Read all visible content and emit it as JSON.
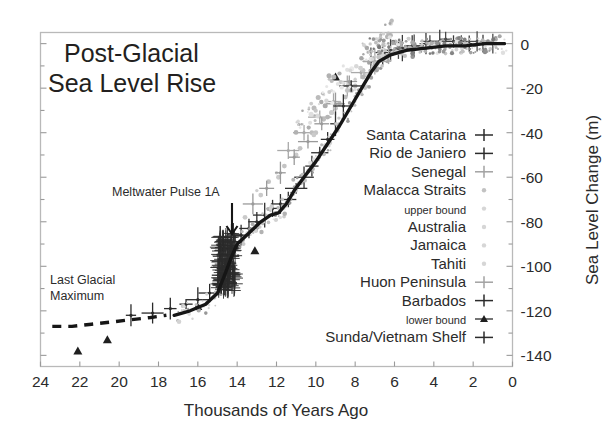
{
  "chart_data": {
    "type": "scatter",
    "title": "Post-Glacial\nSea Level Rise",
    "title_line1": "Post-Glacial",
    "title_line2": "Sea Level Rise",
    "xlabel": "Thousands of Years Ago",
    "ylabel": "Sea Level Change (m)",
    "xlim": [
      24,
      0
    ],
    "ylim": [
      -145,
      5
    ],
    "x_ticks": [
      24,
      22,
      20,
      18,
      16,
      14,
      12,
      10,
      8,
      6,
      4,
      2,
      0
    ],
    "y_ticks": [
      0,
      -20,
      -40,
      -60,
      -80,
      -100,
      -120,
      -140
    ],
    "y_minor_step": 10,
    "x_axis_inverted": true,
    "y_axis_side": "right",
    "grid": false,
    "legend_position": "inside-right",
    "annotations": [
      {
        "text": "Meltwater Pulse 1A",
        "x": 16.2,
        "y": -62,
        "arrow_to_x": 14.6,
        "arrow_to_y": -92
      },
      {
        "text": "Last Glacial\nMaximum",
        "line1": "Last Glacial",
        "line2": "Maximum",
        "x": 22.6,
        "y": -104
      }
    ],
    "series": [
      {
        "name": "Santa Catarina",
        "marker": "plus-errorbar",
        "color": "#3a3a3a",
        "x": [
          6.6,
          6.2,
          5.6,
          5.1,
          4.4,
          3.7,
          3.0,
          2.2,
          1.5
        ],
        "y": [
          -4,
          -3,
          -2,
          -1,
          0,
          1,
          1,
          0,
          0
        ]
      },
      {
        "name": "Rio de Janiero",
        "marker": "plus-errorbar",
        "color": "#4a4a4a",
        "x": [
          7.2,
          6.5,
          5.8,
          5.0,
          4.2,
          3.4,
          2.6,
          1.8,
          1.0
        ],
        "y": [
          -8,
          -5,
          -3,
          -1,
          1,
          2,
          1,
          1,
          0
        ]
      },
      {
        "name": "Senegal",
        "marker": "plus-errorbar",
        "color": "#a9a9a9",
        "x": [
          11.4,
          10.6,
          9.8,
          9.1,
          8.4,
          7.7,
          7.0,
          6.3
        ],
        "y": [
          -48,
          -40,
          -33,
          -26,
          -19,
          -13,
          -8,
          -5
        ]
      },
      {
        "name": "Malacca Straits",
        "marker": "dot",
        "color": "#bdbdbd",
        "x": [
          10.2,
          9.6,
          9.0,
          8.5,
          8.0,
          7.5,
          7.0,
          6.4,
          5.8
        ],
        "y": [
          -40,
          -34,
          -29,
          -24,
          -19,
          -14,
          -9,
          -6,
          -4
        ]
      },
      {
        "name": "upper bound",
        "marker": "dot-small",
        "color": "#cfcfcf",
        "x": [
          13.0,
          12.0,
          11.0,
          10.0,
          9.0,
          8.0,
          7.0
        ],
        "y": [
          -66,
          -58,
          -50,
          -40,
          -29,
          -16,
          -6
        ]
      },
      {
        "name": "Australia",
        "marker": "dot",
        "color": "#c4c4c4",
        "x": [
          12.4,
          11.6,
          10.8,
          10.0,
          9.2,
          8.4,
          7.6,
          6.8
        ],
        "y": [
          -62,
          -55,
          -47,
          -40,
          -31,
          -21,
          -12,
          -6
        ]
      },
      {
        "name": "Jamaica",
        "marker": "dot",
        "color": "#b5b5b5",
        "x": [
          9.4,
          8.8,
          8.2,
          7.6,
          7.0,
          6.4
        ],
        "y": [
          -33,
          -27,
          -21,
          -15,
          -10,
          -6
        ]
      },
      {
        "name": "Tahiti",
        "marker": "dot",
        "color": "#cacaca",
        "x": [
          13.6,
          12.8,
          11.9,
          11.0,
          10.1,
          9.2,
          8.3
        ],
        "y": [
          -78,
          -68,
          -60,
          -50,
          -41,
          -31,
          -18
        ]
      },
      {
        "name": "Huon Peninsula",
        "marker": "plus-errorbar",
        "color": "#9a9a9a",
        "x": [
          13.2,
          12.5,
          11.8,
          11.1,
          10.4,
          9.7,
          9.0,
          8.3
        ],
        "y": [
          -72,
          -65,
          -58,
          -51,
          -44,
          -36,
          -27,
          -17
        ]
      },
      {
        "name": "Barbados",
        "marker": "plus-errorbar",
        "color": "#2f2f2f",
        "x": [
          14.8,
          14.6,
          14.5,
          14.4,
          14.3,
          14.1,
          13.8,
          13.4,
          13.0,
          12.6,
          12.2,
          11.8,
          11.4,
          11.0,
          10.6,
          10.2,
          9.8,
          9.4,
          9.0,
          8.6,
          8.2
        ],
        "y": [
          -104,
          -101,
          -98,
          -95,
          -92,
          -89,
          -86,
          -83,
          -80,
          -77,
          -74,
          -72,
          -70,
          -65,
          -60,
          -55,
          -49,
          -43,
          -36,
          -28,
          -19
        ]
      },
      {
        "name": "lower bound",
        "marker": "triangle",
        "color": "#1f1f1f",
        "x": [
          22.1,
          20.6,
          16.0,
          13.1,
          9.0
        ],
        "y": [
          -138,
          -133,
          -118,
          -93,
          -15
        ]
      },
      {
        "name": "Sunda/Vietnam Shelf",
        "marker": "plus-errorbar",
        "color": "#2a2a2a",
        "x": [
          19.4,
          18.3,
          17.4,
          16.6,
          16.0,
          15.4,
          14.9
        ],
        "y": [
          -122,
          -121,
          -119,
          -117,
          -115,
          -112,
          -108
        ]
      }
    ],
    "fit_curve": {
      "name": "best-fit sea level curve",
      "x": [
        17.2,
        16.4,
        15.6,
        15.0,
        14.6,
        14.3,
        14.0,
        13.4,
        12.8,
        12.3,
        11.9,
        11.5,
        11.1,
        10.6,
        10.0,
        9.4,
        8.8,
        8.2,
        7.6,
        7.2,
        6.8,
        6.2,
        5.4,
        4.4,
        3.4,
        2.4,
        1.4,
        0.4
      ],
      "y": [
        -122,
        -120,
        -117,
        -112,
        -103,
        -96,
        -90,
        -85,
        -80,
        -77,
        -76,
        -72,
        -66,
        -60,
        -53,
        -45,
        -37,
        -28,
        -19,
        -13,
        -8,
        -5,
        -3,
        -2,
        -1,
        -1,
        0,
        0
      ]
    },
    "dashed_curve": {
      "name": "last glacial maximum dashed extension",
      "x": [
        23.4,
        22.4,
        21.4,
        20.4,
        19.4,
        18.4,
        17.6
      ],
      "y": [
        -127,
        -127,
        -126,
        -125,
        -124,
        -123,
        -122
      ]
    }
  },
  "legend": {
    "entries": [
      {
        "label": "Santa Catarina",
        "marker": "plus",
        "size": "normal"
      },
      {
        "label": "Rio de Janiero",
        "marker": "plus",
        "size": "normal"
      },
      {
        "label": "Senegal",
        "marker": "plus-light",
        "size": "normal"
      },
      {
        "label": "Malacca Straits",
        "marker": "dot-light",
        "size": "normal"
      },
      {
        "label": "upper bound",
        "marker": "dot-faint",
        "size": "small"
      },
      {
        "label": "Australia",
        "marker": "dot-faint",
        "size": "normal"
      },
      {
        "label": "Jamaica",
        "marker": "dot-faint",
        "size": "normal"
      },
      {
        "label": "Tahiti",
        "marker": "dot-faint",
        "size": "normal"
      },
      {
        "label": "Huon Peninsula",
        "marker": "plus-light",
        "size": "normal"
      },
      {
        "label": "Barbados",
        "marker": "plus",
        "size": "normal"
      },
      {
        "label": "lower bound",
        "marker": "triangle",
        "size": "small"
      },
      {
        "label": "Sunda/Vietnam Shelf",
        "marker": "plus",
        "size": "normal"
      }
    ]
  },
  "colors": {
    "axis": "#b9b9b9",
    "text": "#2b2b2b",
    "curve": "#161616",
    "background": "#ffffff"
  }
}
